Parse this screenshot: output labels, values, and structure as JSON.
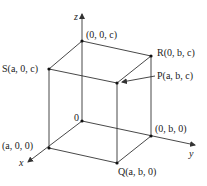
{
  "diagram": {
    "type": "3d-rectangular-box",
    "axes": {
      "x": {
        "label": "x"
      },
      "y": {
        "label": "y"
      },
      "z": {
        "label": "z"
      }
    },
    "points": {
      "origin": {
        "label": "0"
      },
      "zc": {
        "label": "(0, 0, c)"
      },
      "R": {
        "label": "R(0, b, c)"
      },
      "S": {
        "label": "S(a, 0, c)"
      },
      "P": {
        "label": "P(a, b, c)"
      },
      "yb": {
        "label": "(0, b, 0)"
      },
      "xa": {
        "label": "(a, 0, 0)"
      },
      "Q": {
        "label": "Q(a, b, 0)"
      }
    },
    "colors": {
      "line": "#333333",
      "text": "#222222",
      "background": "#ffffff"
    }
  }
}
